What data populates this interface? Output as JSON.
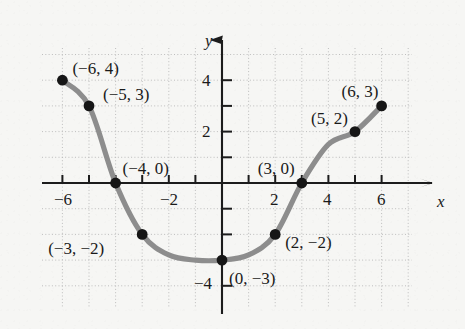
{
  "chart_data": {
    "type": "line",
    "title": "",
    "subtitle": "",
    "xlabel": "x",
    "ylabel": "y",
    "xlim": [
      -7,
      7
    ],
    "ylim": [
      -5,
      5
    ],
    "xticks": [
      -6,
      -5,
      -4,
      -3,
      -2,
      -1,
      1,
      2,
      3,
      4,
      5,
      6
    ],
    "yticks": [
      -4,
      -3,
      -2,
      -1,
      1,
      2,
      3,
      4
    ],
    "xtick_labels_shown": [
      "-6",
      "-2",
      "2",
      "4",
      "6"
    ],
    "ytick_labels_shown": [
      "4",
      "2",
      "-4"
    ],
    "grid": true,
    "grid_style": "dotted",
    "grid_spacing": 1,
    "legend": "none",
    "series": [
      {
        "name": "curve",
        "color": "#8d8d8d",
        "x": [
          -6,
          -5,
          -4,
          -3,
          -2,
          -1,
          0,
          1,
          2,
          3,
          4,
          5,
          6
        ],
        "y": [
          4,
          3,
          0,
          -2,
          -2.8,
          -3,
          -3,
          -2.8,
          -2,
          0,
          1.5,
          2,
          3
        ]
      }
    ],
    "points": [
      {
        "x": -6,
        "y": 4,
        "label": "(−6, 4)",
        "label_dx": 10,
        "label_dy": -20
      },
      {
        "x": -5,
        "y": 3,
        "label": "(−5, 3)",
        "label_dx": 14,
        "label_dy": -20
      },
      {
        "x": -4,
        "y": 0,
        "label": "(−4, 0)",
        "label_dx": 7,
        "label_dy": -23
      },
      {
        "x": -3,
        "y": -2,
        "label": "(−3, −2)",
        "label_dx": -94,
        "label_dy": 6
      },
      {
        "x": 0,
        "y": -3,
        "label": "(0, −3)",
        "label_dx": 7,
        "label_dy": 10
      },
      {
        "x": 2,
        "y": -2,
        "label": "(2, −2)",
        "label_dx": 10,
        "label_dy": 0
      },
      {
        "x": 3,
        "y": 0,
        "label": "(3, 0)",
        "label_dx": -44,
        "label_dy": -23
      },
      {
        "x": 5,
        "y": 2,
        "label": "(5, 2)",
        "label_dx": -44,
        "label_dy": -22
      },
      {
        "x": 6,
        "y": 3,
        "label": "(6, 3)",
        "label_dx": -40,
        "label_dy": -23
      }
    ],
    "annotations": []
  },
  "axes": {
    "x_axis_name": "x",
    "y_axis_name": "y"
  },
  "colors": {
    "background": "#f6f6f4",
    "curve": "#8d8d8d",
    "point": "#161616",
    "axis": "#1c1c1c",
    "grid": "#b9b9b9",
    "text": "#1a1a1a"
  }
}
